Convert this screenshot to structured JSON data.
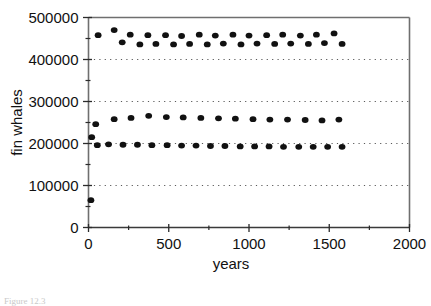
{
  "chart_data": {
    "type": "scatter",
    "title": "",
    "subtitle": "",
    "xlabel": "years",
    "ylabel": "fin whales",
    "xlim": [
      0,
      2000
    ],
    "ylim": [
      0,
      500000
    ],
    "grid": true,
    "grid_style": "dotted horizontal at y major ticks",
    "legend_position": "none",
    "x_major_ticks": [
      0,
      500,
      1000,
      1500,
      2000
    ],
    "x_minor_tick_interval": 250,
    "y_major_ticks": [
      0,
      100000,
      200000,
      300000,
      400000,
      500000
    ],
    "y_minor_tick_interval": 50000,
    "x_tick_labels": [
      "0",
      "500",
      "1000",
      "1500",
      "2000"
    ],
    "y_tick_labels": [
      "0",
      "100000",
      "200000",
      "300000",
      "400000",
      "500000"
    ],
    "marker": "filled-circle",
    "marker_color": "#111111",
    "series": [
      {
        "name": "upper-band-a",
        "x": [
          60,
          160,
          260,
          370,
          480,
          580,
          690,
          790,
          900,
          1000,
          1110,
          1210,
          1320,
          1420,
          1530
        ],
        "y": [
          458000,
          470000,
          459000,
          458000,
          458000,
          456000,
          459000,
          457000,
          459000,
          457000,
          458000,
          459000,
          457000,
          459000,
          462000
        ]
      },
      {
        "name": "upper-band-b",
        "x": [
          210,
          320,
          420,
          530,
          630,
          740,
          840,
          950,
          1050,
          1160,
          1260,
          1370,
          1470,
          1580
        ],
        "y": [
          441000,
          436000,
          437000,
          436000,
          437000,
          436000,
          438000,
          436000,
          438000,
          437000,
          438000,
          437000,
          439000,
          437000
        ]
      },
      {
        "name": "mid-band",
        "x": [
          45,
          160,
          265,
          375,
          485,
          590,
          700,
          810,
          915,
          1025,
          1130,
          1240,
          1350,
          1455,
          1560
        ],
        "y": [
          246000,
          258000,
          261000,
          266000,
          263000,
          262000,
          261000,
          260000,
          259000,
          258000,
          257000,
          257000,
          256000,
          255000,
          257000
        ]
      },
      {
        "name": "lower-band",
        "x": [
          20,
          55,
          125,
          215,
          305,
          395,
          490,
          580,
          670,
          760,
          850,
          945,
          1035,
          1125,
          1215,
          1310,
          1400,
          1490,
          1580
        ],
        "y": [
          215000,
          196000,
          198000,
          197000,
          197000,
          196000,
          196000,
          195000,
          195000,
          194000,
          194000,
          193000,
          193000,
          193000,
          192000,
          192000,
          192000,
          192000,
          192000
        ]
      },
      {
        "name": "origin-point",
        "x": [
          15
        ],
        "y": [
          65000
        ]
      }
    ]
  },
  "caption": {
    "text": "Figure 12.3"
  }
}
